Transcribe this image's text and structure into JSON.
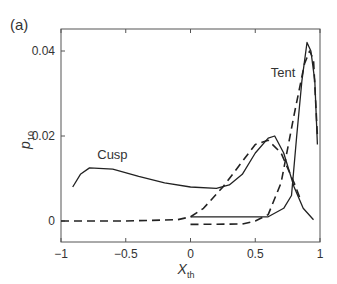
{
  "panel_label": "(a)",
  "chart_data": {
    "type": "line",
    "title": "",
    "xlabel": "X",
    "xlabel_sub": "th",
    "ylabel": "p",
    "ylabel_sub": "10",
    "xlim": [
      -1,
      1
    ],
    "ylim": [
      -0.005,
      0.045
    ],
    "x_ticks": [
      -1,
      -0.5,
      0,
      0.5,
      1
    ],
    "x_tick_labels": [
      "−1",
      "−0.5",
      "0",
      "0.5",
      "1"
    ],
    "y_ticks": [
      0,
      0.02,
      0.04
    ],
    "y_tick_labels": [
      "0",
      "0.02",
      "0.04"
    ],
    "grid": false,
    "annotations": [
      {
        "text": "Cusp",
        "x": -0.72,
        "y": 0.0145
      },
      {
        "text": "Tent",
        "x": 0.62,
        "y": 0.034
      }
    ],
    "series": [
      {
        "name": "Cusp (solid)",
        "style": "solid",
        "x": [
          -0.91,
          -0.85,
          -0.78,
          -0.6,
          -0.4,
          -0.2,
          0,
          0.2,
          0.3,
          0.4,
          0.5,
          0.6,
          0.65,
          0.72,
          0.8,
          0.87,
          0.95
        ],
        "y": [
          0.008,
          0.011,
          0.0125,
          0.0122,
          0.0105,
          0.009,
          0.008,
          0.0077,
          0.0085,
          0.011,
          0.016,
          0.0195,
          0.02,
          0.016,
          0.008,
          0.003,
          0.0003
        ]
      },
      {
        "name": "Cusp (dashed)",
        "style": "dashed",
        "x": [
          -1,
          -0.5,
          -0.1,
          0,
          0.1,
          0.25,
          0.4,
          0.5,
          0.6,
          0.7,
          0.8,
          0.85
        ],
        "y": [
          0,
          0,
          0.0003,
          0.001,
          0.003,
          0.008,
          0.014,
          0.018,
          0.019,
          0.016,
          0.009,
          0.005
        ]
      },
      {
        "name": "Tent (dashed)",
        "style": "dashed",
        "x": [
          0,
          0.4,
          0.5,
          0.6,
          0.7,
          0.8,
          0.88,
          0.92,
          0.95,
          0.98
        ],
        "y": [
          -0.0008,
          -0.0007,
          0,
          0.0015,
          0.009,
          0.025,
          0.037,
          0.04,
          0.038,
          0.02
        ]
      },
      {
        "name": "Tent (solid)",
        "style": "solid",
        "x": [
          0,
          0.6,
          0.72,
          0.78,
          0.82,
          0.86,
          0.9,
          0.93,
          0.96,
          0.98
        ],
        "y": [
          0.001,
          0.001,
          0.003,
          0.006,
          0.02,
          0.033,
          0.042,
          0.04,
          0.033,
          0.018
        ]
      }
    ]
  }
}
